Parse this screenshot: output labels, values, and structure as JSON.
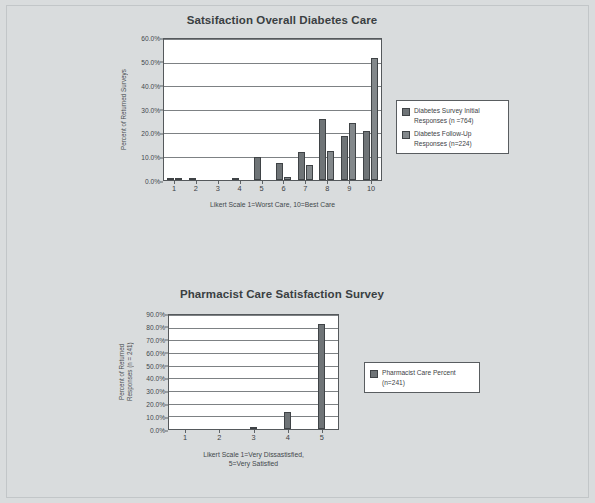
{
  "page": {
    "background_color": "#d9dcdd",
    "frame_color": "#c2c6c8"
  },
  "colors": {
    "series1": "#6f7477",
    "series2": "#83888b",
    "axis": "#55595c",
    "grid": "#7d8184",
    "text": "#3d4245"
  },
  "chart_data": [
    {
      "type": "bar",
      "title": "Satsifaction Overall Diabetes Care",
      "xlabel": "Likert Scale 1=Worst Care, 10=Best Care",
      "ylabel": "Percent of Returned Surveys",
      "categories": [
        "1",
        "2",
        "3",
        "4",
        "5",
        "6",
        "7",
        "8",
        "9",
        "10"
      ],
      "ylim": [
        0,
        60
      ],
      "yticks": [
        "0.0%",
        "10.0%",
        "20.0%",
        "30.0%",
        "40.0%",
        "50.0%",
        "60.0%"
      ],
      "ytick_values": [
        0,
        10,
        20,
        30,
        40,
        50,
        60
      ],
      "grid": true,
      "legend_position": "right",
      "series": [
        {
          "name": "Diabetes Survey Initial Responses (n =764)",
          "values": [
            1.0,
            0.4,
            0.0,
            0.9,
            9.6,
            7.3,
            11.9,
            26.0,
            18.6,
            20.8
          ]
        },
        {
          "name": "Diabetes Follow-Up Responses (n=224)",
          "values": [
            0.9,
            0.0,
            0.0,
            0.0,
            0.0,
            1.3,
            6.2,
            12.4,
            24.1,
            51.9
          ]
        }
      ]
    },
    {
      "type": "bar",
      "title": "Pharmacist Care Satisfaction Survey",
      "xlabel": "Likert Scale 1=Very Dissastisfied,\n5=Very Satisfied",
      "ylabel": "Percent of Returned\nResponses (n = 241)",
      "categories": [
        "1",
        "2",
        "3",
        "4",
        "5"
      ],
      "ylim": [
        0,
        90
      ],
      "yticks": [
        "0.0%",
        "10.0%",
        "20.0%",
        "30.0%",
        "40.0%",
        "50.0%",
        "60.0%",
        "70.0%",
        "80.0%",
        "90.0%"
      ],
      "ytick_values": [
        0,
        10,
        20,
        30,
        40,
        50,
        60,
        70,
        80,
        90
      ],
      "grid": true,
      "legend_position": "right",
      "series": [
        {
          "name": "Pharmacist Care  Percent (n=241)",
          "values": [
            0.0,
            0.0,
            1.2,
            13.7,
            83.0
          ]
        }
      ]
    }
  ],
  "chart1": {
    "title": "Satsifaction Overall Diabetes Care",
    "xlabel": "Likert Scale 1=Worst Care, 10=Best Care",
    "ylabel": "Percent of Returned Surveys",
    "legend": [
      {
        "label": "Diabetes Survey Initial\nResponses (n =764)"
      },
      {
        "label": "Diabetes Follow-Up\nResponses (n=224)"
      }
    ]
  },
  "chart2": {
    "title": "Pharmacist Care Satisfaction Survey",
    "xlabel": "Likert Scale 1=Very Dissastisfied,\n5=Very Satisfied",
    "ylabel": "Percent of Returned\nResponses (n = 241)",
    "legend": [
      {
        "label": "Pharmacist Care  Percent\n(n=241)"
      }
    ]
  }
}
